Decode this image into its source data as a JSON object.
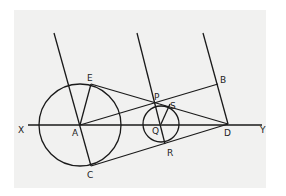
{
  "diagram": {
    "labels": {
      "X": "X",
      "Y": "Y",
      "A": "A",
      "B": "B",
      "C": "C",
      "D": "D",
      "E": "E",
      "P": "P",
      "Q": "Q",
      "R": "R",
      "S": "S"
    },
    "points": {
      "A": [
        80,
        125
      ],
      "D": [
        228,
        124
      ],
      "Q": [
        161,
        124
      ],
      "P": [
        157,
        103
      ],
      "S": [
        170,
        104
      ],
      "R": [
        164,
        144
      ],
      "B": [
        218,
        84
      ],
      "E": [
        91,
        84
      ],
      "C": [
        91,
        166
      ]
    },
    "circles": [
      {
        "center": "A",
        "radius": 41
      },
      {
        "center": "Q",
        "radius": 18
      }
    ],
    "stroke_color": "#1a1a1a",
    "background_color": "#f1f1f0"
  }
}
